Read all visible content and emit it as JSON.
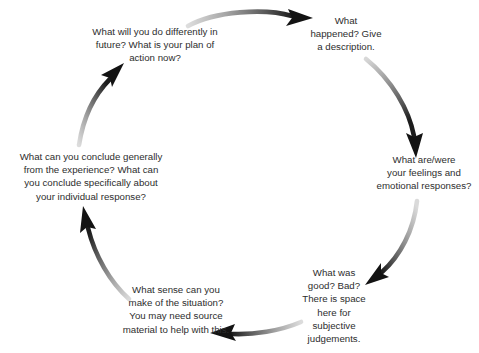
{
  "diagram": {
    "type": "cyclical-process",
    "direction": "clockwise",
    "stage_count": 6,
    "text_color": "#2d2d2d",
    "background_color": "#ffffff",
    "arrow_gradient": {
      "tail": "#d9d9d9",
      "head": "#1c1c1c"
    },
    "stages": [
      {
        "id": "description",
        "position": "top-right",
        "text": "What\nhappened? Give\na description."
      },
      {
        "id": "feelings",
        "position": "right",
        "text": "What are/were\nyour feelings and\nemotional responses?"
      },
      {
        "id": "evaluation",
        "position": "bottom-right",
        "text": "What was\ngood? Bad?\nThere is space\nhere for\nsubjective\njudgements."
      },
      {
        "id": "analysis",
        "position": "bottom-left",
        "text": "What sense can you\nmake of the situation?\nYou may need source\nmaterial to help with this."
      },
      {
        "id": "conclusion",
        "position": "left",
        "text": "What can you conclude generally\nfrom the experience? What can\nyou conclude specifically about\nyour individual response?"
      },
      {
        "id": "action-plan",
        "position": "top-left",
        "text": "What will you do differently in\nfuture? What is your plan of\naction now?"
      }
    ],
    "arrows": [
      {
        "id": "arrow-action-to-description",
        "from": "action-plan",
        "to": "description",
        "location": "top"
      },
      {
        "id": "arrow-description-to-feelings",
        "from": "description",
        "to": "feelings",
        "location": "upper-right"
      },
      {
        "id": "arrow-feelings-to-evaluation",
        "from": "feelings",
        "to": "evaluation",
        "location": "lower-right"
      },
      {
        "id": "arrow-evaluation-to-analysis",
        "from": "evaluation",
        "to": "analysis",
        "location": "bottom"
      },
      {
        "id": "arrow-analysis-to-conclusion",
        "from": "analysis",
        "to": "conclusion",
        "location": "lower-left"
      },
      {
        "id": "arrow-conclusion-to-action",
        "from": "conclusion",
        "to": "action-plan",
        "location": "upper-left"
      }
    ]
  }
}
